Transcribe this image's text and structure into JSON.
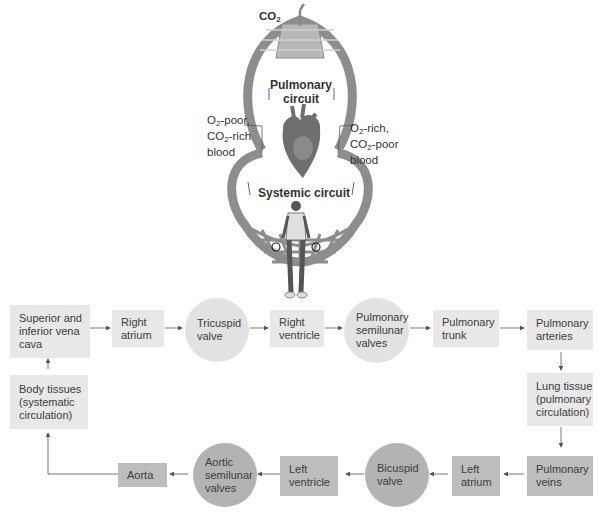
{
  "figure": {
    "co2_label": "CO2",
    "pulmonary_circuit": "Pulmonary\ncircuit",
    "systemic_circuit": "Systemic circuit",
    "left_blood_label": "O2-poor,\nCO2-rich\nblood",
    "right_blood_label": "O2-rich,\nCO2-poor\nblood",
    "tissue_co2": "CO2",
    "tissue_o2": "O2"
  },
  "flow": {
    "nodes": [
      {
        "id": "vena_cava",
        "label": "Superior and\ninferior vena\ncava",
        "shape": "rect",
        "shade": "light"
      },
      {
        "id": "right_atrium",
        "label": "Right\natrium",
        "shape": "rect",
        "shade": "light"
      },
      {
        "id": "tricuspid",
        "label": "Tricuspid\nvalve",
        "shape": "circle",
        "shade": "light"
      },
      {
        "id": "right_ventricle",
        "label": "Right\nventricle",
        "shape": "rect",
        "shade": "light"
      },
      {
        "id": "pulm_semilunar",
        "label": "Pulmonary\nsemilunar\nvalves",
        "shape": "circle",
        "shade": "light"
      },
      {
        "id": "pulm_trunk",
        "label": "Pulmonary\ntrunk",
        "shape": "rect",
        "shade": "light"
      },
      {
        "id": "pulm_arteries",
        "label": "Pulmonary\narteries",
        "shape": "rect",
        "shade": "light"
      },
      {
        "id": "lung_tissue",
        "label": "Lung tissue\n(pulmonary\ncirculation)",
        "shape": "rect",
        "shade": "light"
      },
      {
        "id": "pulm_veins",
        "label": "Pulmonary\nveins",
        "shape": "rect",
        "shade": "dark"
      },
      {
        "id": "left_atrium",
        "label": "Left\natrium",
        "shape": "rect",
        "shade": "dark"
      },
      {
        "id": "bicuspid",
        "label": "Bicuspid\nvalve",
        "shape": "circle",
        "shade": "dark"
      },
      {
        "id": "left_ventricle",
        "label": "Left\nventricle",
        "shape": "rect",
        "shade": "dark"
      },
      {
        "id": "aortic_semilunar",
        "label": "Aortic\nsemilunar\nvalves",
        "shape": "circle",
        "shade": "dark"
      },
      {
        "id": "aorta",
        "label": "Aorta",
        "shape": "rect",
        "shade": "dark"
      },
      {
        "id": "body_tissues",
        "label": "Body tissues\n(systematic\ncirculation)",
        "shape": "rect",
        "shade": "light"
      }
    ]
  },
  "colors": {
    "light_fill": "#e8e8e8",
    "dark_fill": "#bdbdbd",
    "vessel": "#8a8a8a",
    "arrow": "#555555"
  }
}
